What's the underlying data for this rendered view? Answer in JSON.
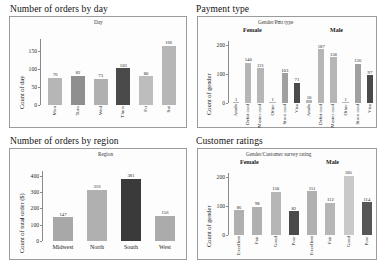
{
  "dashboard": {
    "background": "#ffffff",
    "panels": [
      {
        "name": "orders-by-day",
        "title": "Number of orders by day",
        "field_caption": "Day",
        "ylabel": "Count of day"
      },
      {
        "name": "payment-type",
        "title": "Payment type",
        "field_caption": "Gender/Pmt type",
        "ylabel": "Count of gender",
        "group_labels": [
          "Female",
          "Male"
        ]
      },
      {
        "name": "orders-by-region",
        "title": "Number of orders by region",
        "field_caption": "Region",
        "ylabel": "Count of total order ($)"
      },
      {
        "name": "customer-ratings",
        "title": "Customer ratings",
        "field_caption": "Gender/Customer survey rating",
        "ylabel": "Count of gender",
        "group_labels": [
          "Female",
          "Male"
        ]
      }
    ]
  },
  "colors": {
    "bar_light": "#b6b6b6",
    "bar_mid": "#a8a8a8",
    "bar_dark": "#3a3a3a",
    "bar_pale": "#c9c9c9",
    "axis": "#8a8a8a",
    "frame": "#9b9b9b",
    "text": "#141414"
  },
  "chart_data": [
    {
      "type": "bar",
      "name": "orders-by-day",
      "title": "Number of orders by day",
      "xlabel": "Day",
      "ylabel": "Count of day",
      "ylim": [
        0,
        185
      ],
      "yticks": [
        0,
        50,
        100,
        150
      ],
      "grid": false,
      "categories": [
        "Mon",
        "Tues",
        "Wed",
        "Thurs",
        "Fri",
        "Sat"
      ],
      "values": [
        76,
        82,
        73,
        103,
        80,
        166
      ],
      "bar_colors": [
        "#b6b6b6",
        "#8f8f8f",
        "#b0b0b0",
        "#4a4a4a",
        "#bdbdbd",
        "#b6b6b6"
      ]
    },
    {
      "type": "bar",
      "name": "payment-type",
      "title": "Payment type",
      "xlabel": "Gender/Pmt type",
      "ylabel": "Count of gender",
      "ylim": [
        0,
        215
      ],
      "yticks": [
        0,
        100,
        200
      ],
      "grid": false,
      "groups": [
        "Female",
        "Male"
      ],
      "categories": [
        "Amdx",
        "Debit card",
        "Master card",
        "Other",
        "Store card",
        "Visa"
      ],
      "series": [
        {
          "name": "Female",
          "categories": [
            "Amdx",
            "Debit card",
            "Master card",
            "Other",
            "Store card",
            "Visa"
          ],
          "values": [
            1,
            140,
            121,
            1,
            103,
            71
          ],
          "bar_colors": [
            "#b6b6b6",
            "#b6b6b6",
            "#b6b6b6",
            "#b6b6b6",
            "#a0a0a0",
            "#4a4a4a"
          ]
        },
        {
          "name": "Male",
          "categories": [
            "Amdx",
            "Debit card",
            "Master card",
            "Other",
            "Store card",
            "Visa"
          ],
          "values": [
            10,
            187,
            158,
            1,
            136,
            97
          ],
          "bar_colors": [
            "#b6b6b6",
            "#b6b6b6",
            "#b6b6b6",
            "#b6b6b6",
            "#a0a0a0",
            "#4a4a4a"
          ]
        }
      ]
    },
    {
      "type": "bar",
      "name": "orders-by-region",
      "title": "Number of orders by region",
      "xlabel": "Region",
      "ylabel": "Count of total order ($)",
      "ylim": [
        0,
        430
      ],
      "yticks": [
        0,
        100,
        200,
        300,
        400
      ],
      "grid": false,
      "categories": [
        "Midwest",
        "North",
        "South",
        "West"
      ],
      "values": [
        147,
        316,
        381,
        156
      ],
      "bar_colors": [
        "#a8a8a8",
        "#b0b0b0",
        "#3a3a3a",
        "#ababab"
      ]
    },
    {
      "type": "bar",
      "name": "customer-ratings",
      "title": "Customer ratings",
      "xlabel": "Gender/Customer survey rating",
      "ylabel": "Count of gender",
      "ylim": [
        0,
        215
      ],
      "yticks": [
        0,
        100,
        200
      ],
      "grid": false,
      "groups": [
        "Female",
        "Male"
      ],
      "categories": [
        "Excellent",
        "Fair",
        "Good",
        "Poor"
      ],
      "series": [
        {
          "name": "Female",
          "categories": [
            "Excellent",
            "Fair",
            "Good",
            "Poor"
          ],
          "values": [
            86,
            98,
            150,
            82
          ],
          "bar_colors": [
            "#b0b0b0",
            "#b0b0b0",
            "#b6b6b6",
            "#4a4a4a"
          ]
        },
        {
          "name": "Male",
          "categories": [
            "Excellent",
            "Fair",
            "Good",
            "Poor"
          ],
          "values": [
            151,
            112,
            205,
            114
          ],
          "bar_colors": [
            "#b0b0b0",
            "#b6b6b6",
            "#c9c9c9",
            "#565656"
          ]
        }
      ]
    }
  ]
}
